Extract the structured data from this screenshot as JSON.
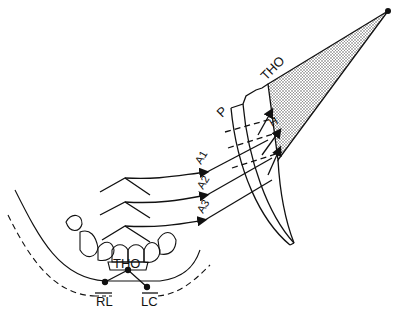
{
  "diagram": {
    "labels": {
      "tho_top": "THO",
      "p": "P",
      "a1": "A1",
      "a2": "A2",
      "a3": "A3",
      "tho_teeth": "THO",
      "rl": "RL",
      "lc": "LC"
    },
    "colors": {
      "ink": "#111111",
      "background": "#ffffff",
      "stipple": "#555555"
    }
  }
}
